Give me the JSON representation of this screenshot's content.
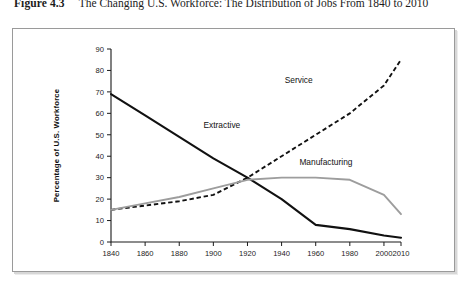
{
  "caption": {
    "figure_number": "Figure 4.3",
    "title": "The Changing U.S. Workforce: The Distribution of Jobs From 1840 to 2010"
  },
  "chart_data": {
    "type": "line",
    "title": "",
    "xlabel": "",
    "ylabel": "Percentage of U.S. Workforce",
    "xlim": [
      1840,
      2010
    ],
    "ylim": [
      0,
      90
    ],
    "grid": false,
    "legend": "inline-labels",
    "xticks": [
      "1840",
      "1860",
      "1880",
      "1900",
      "1920",
      "1940",
      "1960",
      "1980",
      "2000",
      "2010"
    ],
    "yticks": [
      "0",
      "10",
      "20",
      "30",
      "40",
      "50",
      "60",
      "70",
      "80",
      "90"
    ],
    "x": [
      1840,
      1860,
      1880,
      1900,
      1920,
      1940,
      1960,
      1980,
      2000,
      2010
    ],
    "series": [
      {
        "name": "Extractive",
        "style": "solid-black",
        "color": "#111111",
        "label_x": 1905,
        "label_y": 53,
        "values": [
          69,
          59,
          49,
          39,
          30,
          20,
          8,
          6,
          3,
          2
        ]
      },
      {
        "name": "Service",
        "style": "dashed-black",
        "color": "#111111",
        "label_x": 1950,
        "label_y": 74,
        "values": [
          15,
          17,
          19,
          22,
          30,
          40,
          50,
          60,
          73,
          85
        ]
      },
      {
        "name": "Manufacturing",
        "style": "solid-gray",
        "color": "#9d9d9d",
        "label_x": 1966,
        "label_y": 36,
        "values": [
          15,
          18,
          21,
          25,
          29,
          30,
          30,
          29,
          22,
          13
        ]
      }
    ]
  }
}
